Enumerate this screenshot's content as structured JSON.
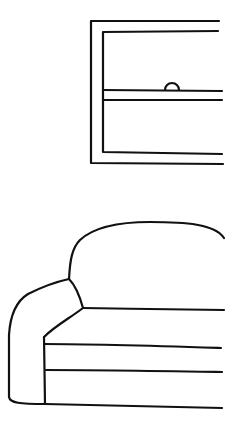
{
  "scene": {
    "description": "Line drawing of a window above a sofa",
    "background": "#ffffff",
    "stroke_color": "#111111",
    "objects": [
      {
        "name": "window",
        "parts": [
          "outer-frame",
          "inner-frame",
          "sash-rail-top",
          "sash-rail-bottom",
          "latch-handle"
        ]
      },
      {
        "name": "sofa",
        "parts": [
          "backrest",
          "armrest",
          "seat-line",
          "cushion-top",
          "cushion-bottom",
          "base"
        ]
      }
    ]
  }
}
